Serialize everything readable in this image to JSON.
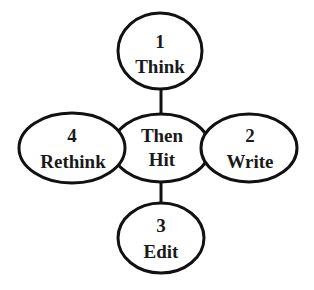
{
  "diagram": {
    "type": "cycle-hub",
    "colors": {
      "stroke": "#111111",
      "fill": "#ffffff",
      "text": "#1a1a1a"
    },
    "center": {
      "line1": "Then",
      "line2": "Hit"
    },
    "nodes": [
      {
        "id": "think",
        "number": "1",
        "label": "Think",
        "position": "top"
      },
      {
        "id": "write",
        "number": "2",
        "label": "Write",
        "position": "right"
      },
      {
        "id": "edit",
        "number": "3",
        "label": "Edit",
        "position": "bottom"
      },
      {
        "id": "rethink",
        "number": "4",
        "label": "Rethink",
        "position": "left"
      }
    ]
  }
}
